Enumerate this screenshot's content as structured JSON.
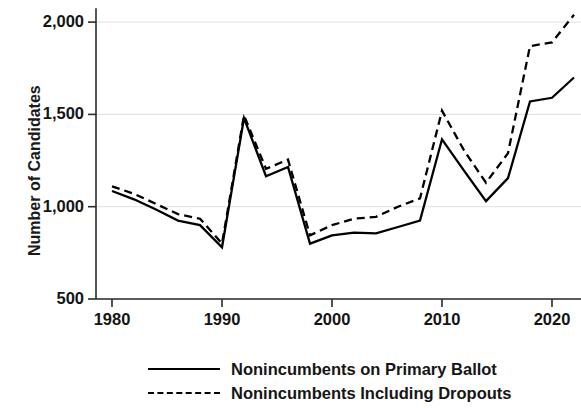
{
  "chart_data": {
    "type": "line",
    "title": "",
    "xlabel": "",
    "ylabel": "Number of Candidates",
    "xlim": [
      1979,
      2023
    ],
    "ylim": [
      500,
      2075
    ],
    "grid": true,
    "legend_position": "bottom",
    "x": [
      1980,
      1982,
      1984,
      1986,
      1988,
      1990,
      1992,
      1994,
      1996,
      1998,
      2000,
      2002,
      2004,
      2006,
      2008,
      2010,
      2012,
      2014,
      2016,
      2018,
      2020,
      2022
    ],
    "xticks": [
      "1980",
      "1990",
      "2000",
      "2010",
      "2020"
    ],
    "xtick_values": [
      1980,
      1990,
      2000,
      2010,
      2020
    ],
    "yticks": [
      "500",
      "1,000",
      "1,500",
      "2,000"
    ],
    "ytick_values": [
      500,
      1000,
      1500,
      2000
    ],
    "series": [
      {
        "name": "Nonincumbents on Primary Ballot",
        "style": "solid",
        "color": "#000000",
        "values": [
          1085,
          1040,
          985,
          925,
          900,
          780,
          1480,
          1165,
          1215,
          800,
          845,
          860,
          855,
          890,
          925,
          1365,
          1195,
          1030,
          1155,
          1570,
          1590,
          1700
        ]
      },
      {
        "name": "Nonincumbents Including Dropouts",
        "style": "dashed",
        "color": "#000000",
        "values": [
          1110,
          1070,
          1015,
          960,
          935,
          800,
          1495,
          1205,
          1255,
          845,
          900,
          935,
          945,
          1000,
          1045,
          1520,
          1305,
          1130,
          1290,
          1870,
          1890,
          2040
        ]
      }
    ]
  },
  "legend": {
    "items": [
      {
        "label": "Nonincumbents on Primary Ballot",
        "style": "solid"
      },
      {
        "label": "Nonincumbents Including Dropouts",
        "style": "dashed"
      }
    ]
  }
}
